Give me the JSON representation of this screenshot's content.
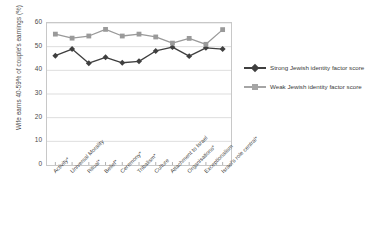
{
  "chart_data": {
    "type": "line",
    "title": "",
    "xlabel": "",
    "ylabel": "Wife earns 40-59% of couple's earnings (%)",
    "ylim": [
      0,
      60
    ],
    "yticks": [
      0,
      10,
      20,
      30,
      40,
      50,
      60
    ],
    "grid": true,
    "legend_position": "right",
    "categories": [
      "Activity*",
      "Universal Morality",
      "Ritual*",
      "Belief*",
      "Ceremony*",
      "Tribalism*",
      "Culture",
      "Attachment to Israel",
      "Organisations*",
      "Exceptionalism",
      "Israel's role central*"
    ],
    "series": [
      {
        "name": "Strong Jewish identity factor score",
        "color": "#3f3f3f",
        "marker": "diamond",
        "values": [
          46.2,
          49.0,
          43.0,
          45.5,
          43.2,
          43.8,
          48.2,
          49.8,
          46.0,
          49.5,
          49.0
        ]
      },
      {
        "name": "Weak Jewish identity factor score",
        "color": "#9a9a9a",
        "marker": "square",
        "values": [
          55.3,
          53.6,
          54.5,
          57.3,
          54.5,
          55.3,
          54.1,
          51.5,
          53.5,
          51.0,
          57.2
        ]
      }
    ]
  },
  "legend": {
    "items": [
      {
        "label": "Strong Jewish identity factor score"
      },
      {
        "label": "Weak Jewish identity factor score"
      }
    ]
  }
}
